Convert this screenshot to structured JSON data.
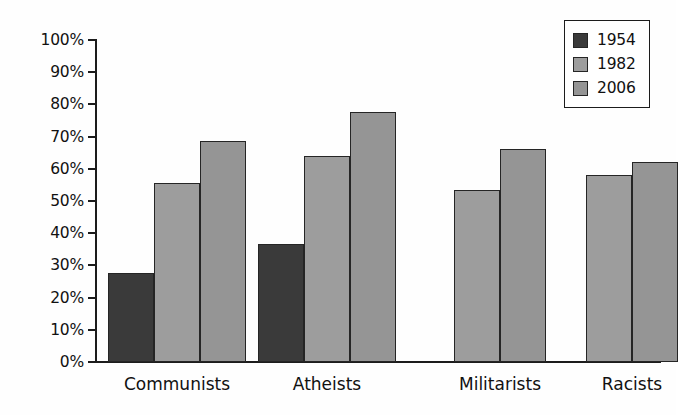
{
  "chart_data": {
    "type": "bar",
    "title": "",
    "subtitle": "",
    "xlabel": "",
    "ylabel": "",
    "categories": [
      "Communists",
      "Atheists",
      "Militarists",
      "Racists"
    ],
    "series": [
      {
        "name": "1954",
        "color": "#3a3a3a",
        "values": [
          27.5,
          36.5,
          null,
          null
        ]
      },
      {
        "name": "1982",
        "color": "#9d9d9d",
        "values": [
          55.5,
          64.0,
          53.5,
          58.0
        ]
      },
      {
        "name": "2006",
        "color": "#959595",
        "values": [
          68.5,
          77.5,
          66.0,
          62.0
        ]
      }
    ],
    "ylim": [
      0,
      100
    ],
    "ytick_labels": [
      "0%",
      "10%",
      "20%",
      "30%",
      "40%",
      "50%",
      "60%",
      "70%",
      "80%",
      "90%",
      "100%"
    ],
    "ytick_values": [
      0,
      10,
      20,
      30,
      40,
      50,
      60,
      70,
      80,
      90,
      100
    ],
    "grid": false,
    "legend_position": "top-right",
    "value_suffix": "%"
  },
  "legend": {
    "entries": [
      {
        "label": "1954",
        "swatch": "legend-swatch-1954"
      },
      {
        "label": "1982",
        "swatch": "legend-swatch-1982"
      },
      {
        "label": "2006",
        "swatch": "legend-swatch-2006"
      }
    ]
  },
  "axes": {
    "y_ticks": [
      "100%",
      "90%",
      "80%",
      "70%",
      "60%",
      "50%",
      "40%",
      "30%",
      "20%",
      "10%",
      "0%"
    ],
    "x_categories": [
      "Communists",
      "Atheists",
      "Militarists",
      "Racists"
    ]
  }
}
